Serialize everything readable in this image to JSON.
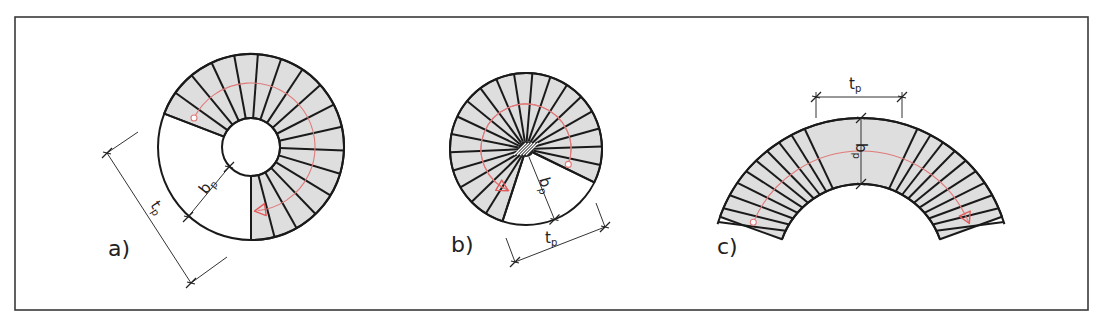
{
  "figure": {
    "frame": {
      "x": 15,
      "y": 17,
      "width": 1073,
      "height": 293,
      "stroke": "#3a3a3a"
    },
    "colors": {
      "tread_fill": "#dedede",
      "line": "#1a1a1a",
      "walkline": "#e07a7a"
    },
    "panels": [
      {
        "id": "a",
        "label": "a)",
        "label_pos": [
          108,
          256
        ],
        "type": "spiral_with_well",
        "center": [
          251,
          147
        ],
        "outer_r": 93,
        "inner_r": 29,
        "start_deg": 201,
        "end_deg": 450,
        "treads": 17,
        "walk_r": 64,
        "dims": {
          "width_label": "b",
          "width_sub": "p",
          "going_label": "t",
          "going_sub": "p"
        }
      },
      {
        "id": "b",
        "label": "b)",
        "label_pos": [
          451,
          252
        ],
        "type": "spiral_central_post",
        "center": [
          526,
          149
        ],
        "outer_r": 76,
        "post_r": 8,
        "start_deg": 108,
        "end_deg": 386,
        "treads": 20,
        "walk_r": 45,
        "dims": {
          "width_label": "b",
          "width_sub": "p",
          "going_label": "t",
          "going_sub": "p"
        }
      },
      {
        "id": "c",
        "label": "c)",
        "label_pos": [
          717,
          254
        ],
        "type": "curved_flight",
        "center": [
          861,
          268
        ],
        "outer_r": 150,
        "inner_r": 84,
        "start_deg": 200,
        "end_deg": 340,
        "walk_r": 117,
        "dims": {
          "width_label": "b",
          "width_sub": "p",
          "going_label": "t",
          "going_sub": "p"
        }
      }
    ]
  }
}
